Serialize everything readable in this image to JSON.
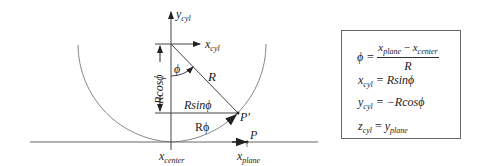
{
  "diagram": {
    "labels": {
      "y_axis": "y",
      "y_axis_sub": "cyl",
      "x_axis": "x",
      "x_axis_sub": "cyl",
      "angle": "ϕ",
      "radius": "R",
      "rcos": "Rcosϕ",
      "rsin": "Rsinϕ",
      "arc": "Rϕ",
      "point_cyl": "P'",
      "point_plane": "P",
      "x_center": "x",
      "x_center_sub": "center",
      "x_plane": "x",
      "x_plane_sub": "plane"
    },
    "colors": {
      "stroke": "#444444",
      "arc": "#888888",
      "text": "#222222"
    }
  },
  "equations": {
    "phi": {
      "lhs": "ϕ =",
      "num_a": "x",
      "num_a_sub": "plane",
      "num_op": " − ",
      "num_b": "x",
      "num_b_sub": "center",
      "den": "R"
    },
    "xcyl": {
      "var": "x",
      "sub": "cyl",
      "rhs": " = Rsinϕ"
    },
    "ycyl": {
      "var": "y",
      "sub": "cyl",
      "rhs": " = −Rcosϕ"
    },
    "zcyl": {
      "var": "z",
      "sub": "cyl",
      "eq": " = ",
      "rvar": "y",
      "rsub": "plane"
    }
  }
}
